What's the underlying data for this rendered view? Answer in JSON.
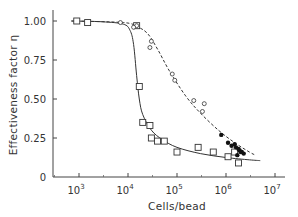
{
  "chart_data": {
    "type": "scatter",
    "title": "",
    "xlabel": "Cells/bead",
    "ylabel": "Effectiveness factor η",
    "xscale": "log",
    "xlim": [
      500,
      10000000
    ],
    "ylim": [
      0,
      1.05
    ],
    "x_ticks": [
      {
        "value": 1000,
        "label": "10",
        "exp": "3"
      },
      {
        "value": 10000,
        "label": "10",
        "exp": "4"
      },
      {
        "value": 100000,
        "label": "10",
        "exp": "5"
      },
      {
        "value": 1000000,
        "label": "10",
        "exp": "6"
      },
      {
        "value": 10000000,
        "label": "10",
        "exp": "7"
      }
    ],
    "y_ticks": [
      {
        "value": 0,
        "label": "0"
      },
      {
        "value": 0.25,
        "label": "0.25"
      },
      {
        "value": 0.5,
        "label": "0.50"
      },
      {
        "value": 0.75,
        "label": "0.75"
      },
      {
        "value": 1.0,
        "label": "1.00"
      }
    ],
    "grid": false,
    "legend": null,
    "series": [
      {
        "name": "open squares",
        "marker": "square-open",
        "points": [
          [
            900,
            1.0
          ],
          [
            1500,
            0.99
          ],
          [
            15000,
            0.97
          ],
          [
            17000,
            0.58
          ],
          [
            20000,
            0.35
          ],
          [
            28000,
            0.33
          ],
          [
            30000,
            0.25
          ],
          [
            40000,
            0.23
          ],
          [
            55000,
            0.23
          ],
          [
            100000,
            0.16
          ],
          [
            270000,
            0.19
          ],
          [
            550000,
            0.16
          ],
          [
            1100000,
            0.13
          ],
          [
            1500000,
            0.16
          ],
          [
            1800000,
            0.09
          ]
        ]
      },
      {
        "name": "open circles",
        "marker": "circle-open",
        "points": [
          [
            7000,
            0.99
          ],
          [
            15000,
            0.97
          ],
          [
            13000,
            0.96
          ],
          [
            30000,
            0.87
          ],
          [
            28000,
            0.83
          ],
          [
            80000,
            0.66
          ],
          [
            90000,
            0.62
          ],
          [
            330000,
            0.42
          ],
          [
            360000,
            0.47
          ],
          [
            220000,
            0.49
          ]
        ]
      },
      {
        "name": "filled circles",
        "marker": "circle-filled",
        "points": [
          [
            800000,
            0.27
          ],
          [
            1100000,
            0.22
          ],
          [
            1300000,
            0.2
          ],
          [
            1500000,
            0.21
          ],
          [
            1600000,
            0.19
          ],
          [
            1800000,
            0.18
          ],
          [
            1900000,
            0.17
          ],
          [
            2000000,
            0.16
          ],
          [
            2100000,
            0.16
          ],
          [
            2300000,
            0.15
          ],
          [
            1700000,
            0.14
          ]
        ]
      }
    ],
    "curves": [
      {
        "name": "model fit (solid)",
        "style": "solid",
        "points": [
          [
            700,
            1.0
          ],
          [
            3000,
            0.995
          ],
          [
            8000,
            0.98
          ],
          [
            11000,
            0.94
          ],
          [
            13000,
            0.85
          ],
          [
            15000,
            0.65
          ],
          [
            17000,
            0.5
          ],
          [
            20000,
            0.4
          ],
          [
            30000,
            0.3
          ],
          [
            50000,
            0.24
          ],
          [
            100000,
            0.19
          ],
          [
            300000,
            0.15
          ],
          [
            1000000,
            0.125
          ],
          [
            3000000,
            0.11
          ],
          [
            5000000,
            0.105
          ]
        ]
      },
      {
        "name": "model fit (dashed)",
        "style": "dashed",
        "points": [
          [
            700,
            1.0
          ],
          [
            8000,
            0.99
          ],
          [
            15000,
            0.965
          ],
          [
            25000,
            0.92
          ],
          [
            40000,
            0.82
          ],
          [
            70000,
            0.68
          ],
          [
            150000,
            0.52
          ],
          [
            300000,
            0.41
          ],
          [
            700000,
            0.3
          ],
          [
            1500000,
            0.22
          ],
          [
            3000000,
            0.16
          ],
          [
            4000000,
            0.14
          ]
        ]
      }
    ]
  }
}
